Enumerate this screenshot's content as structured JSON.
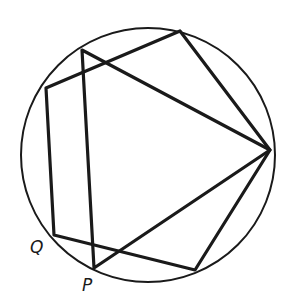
{
  "diagram": {
    "type": "geometry",
    "circle": {
      "cx": 148,
      "cy": 155,
      "r": 127,
      "color": "#1a1a1a"
    },
    "pentagon": {
      "points": [
        [
          46,
          88
        ],
        [
          180,
          31
        ],
        [
          270,
          150
        ],
        [
          195,
          270
        ],
        [
          54,
          235
        ]
      ]
    },
    "triangle": {
      "points": [
        [
          82,
          50
        ],
        [
          270,
          150
        ],
        [
          94,
          268
        ]
      ]
    },
    "labels": {
      "Q": {
        "text": "Q",
        "x": 30,
        "y": 253
      },
      "P": {
        "text": "P",
        "x": 82,
        "y": 291
      }
    }
  }
}
